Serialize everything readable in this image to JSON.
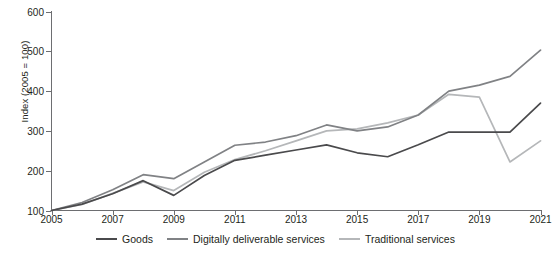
{
  "chart_data": {
    "type": "line",
    "title": "",
    "xlabel": "",
    "ylabel": "Index (2005 = 100)",
    "xlim": [
      2005,
      2021
    ],
    "ylim": [
      100,
      600
    ],
    "yticks": [
      100,
      200,
      300,
      400,
      500,
      600
    ],
    "xticks": [
      2005,
      2007,
      2009,
      2011,
      2013,
      2015,
      2017,
      2019,
      2021
    ],
    "grid": false,
    "legend_position": "bottom",
    "x": [
      2005,
      2006,
      2007,
      2008,
      2009,
      2010,
      2011,
      2012,
      2013,
      2014,
      2015,
      2016,
      2017,
      2018,
      2019,
      2020,
      2021
    ],
    "series": [
      {
        "name": "Goods",
        "color": "#4a4a4c",
        "values": [
          100,
          116,
          142,
          175,
          138,
          188,
          226,
          239,
          252,
          265,
          245,
          235,
          265,
          297,
          297,
          297,
          370
        ]
      },
      {
        "name": "Digitally deliverable services",
        "color": "#808285",
        "values": [
          100,
          120,
          152,
          190,
          180,
          222,
          264,
          272,
          288,
          315,
          300,
          310,
          340,
          400,
          415,
          437,
          503
        ]
      },
      {
        "name": "Traditional services",
        "color": "#b5b7b9",
        "values": [
          100,
          115,
          143,
          172,
          150,
          196,
          228,
          250,
          275,
          300,
          305,
          320,
          340,
          392,
          385,
          222,
          275
        ]
      }
    ]
  },
  "legend": {
    "items": [
      {
        "label": "Goods"
      },
      {
        "label": "Digitally deliverable services"
      },
      {
        "label": "Traditional services"
      }
    ]
  },
  "axes": {
    "y_label": "Index (2005 = 100)",
    "y_tick_labels": [
      "100",
      "200",
      "300",
      "400",
      "500",
      "600"
    ],
    "x_tick_labels": [
      "2005",
      "2007",
      "2009",
      "2011",
      "2013",
      "2015",
      "2017",
      "2019",
      "2021"
    ]
  }
}
